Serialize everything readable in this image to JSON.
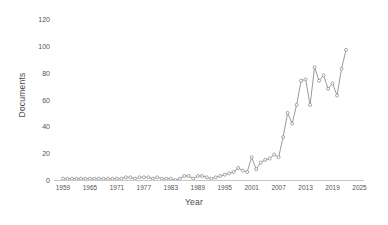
{
  "chart_data": {
    "type": "line",
    "title": "",
    "xlabel": "Year",
    "ylabel": "Documents",
    "xlim": [
      1957,
      2026
    ],
    "ylim": [
      0,
      120
    ],
    "grid": false,
    "legend": null,
    "line_color": "#8f8f8f",
    "marker_color": "#8f8f8f",
    "background_color": "#ffffff",
    "ytick_labels": [
      "0",
      "20",
      "40",
      "60",
      "80",
      "100",
      "120"
    ],
    "ytick_values": [
      0,
      20,
      40,
      60,
      80,
      100,
      120
    ],
    "xtick_labels": [
      "1959",
      "1965",
      "1971",
      "1977",
      "1983",
      "1989",
      "1995",
      "2001",
      "2007",
      "2013",
      "2019",
      "2025"
    ],
    "xtick_values": [
      1959,
      1965,
      1971,
      1977,
      1983,
      1989,
      1995,
      2001,
      2007,
      2013,
      2019,
      2025
    ],
    "x": [
      1959,
      1960,
      1961,
      1962,
      1963,
      1964,
      1965,
      1966,
      1967,
      1968,
      1969,
      1970,
      1971,
      1972,
      1973,
      1974,
      1975,
      1976,
      1977,
      1978,
      1979,
      1980,
      1981,
      1982,
      1983,
      1984,
      1985,
      1986,
      1987,
      1988,
      1989,
      1990,
      1991,
      1992,
      1993,
      1994,
      1995,
      1996,
      1997,
      1998,
      1999,
      2000,
      2001,
      2002,
      2003,
      2004,
      2005,
      2006,
      2007,
      2008,
      2009,
      2010,
      2011,
      2012,
      2013,
      2014,
      2015,
      2016,
      2017,
      2018,
      2019,
      2020,
      2021,
      2022
    ],
    "values": [
      1,
      1,
      1,
      1,
      1,
      1,
      1,
      1,
      1,
      1,
      1,
      1,
      1,
      1,
      2,
      2,
      1,
      2,
      2,
      2,
      1,
      2,
      1,
      1,
      1,
      0,
      1,
      3,
      3,
      1,
      3,
      3,
      2,
      1,
      2,
      3,
      4,
      5,
      6,
      9,
      7,
      6,
      17,
      8,
      13,
      15,
      16,
      19,
      17,
      32,
      50,
      42,
      56,
      74,
      75,
      56,
      84,
      74,
      78,
      68,
      72,
      63,
      83,
      97
    ]
  }
}
